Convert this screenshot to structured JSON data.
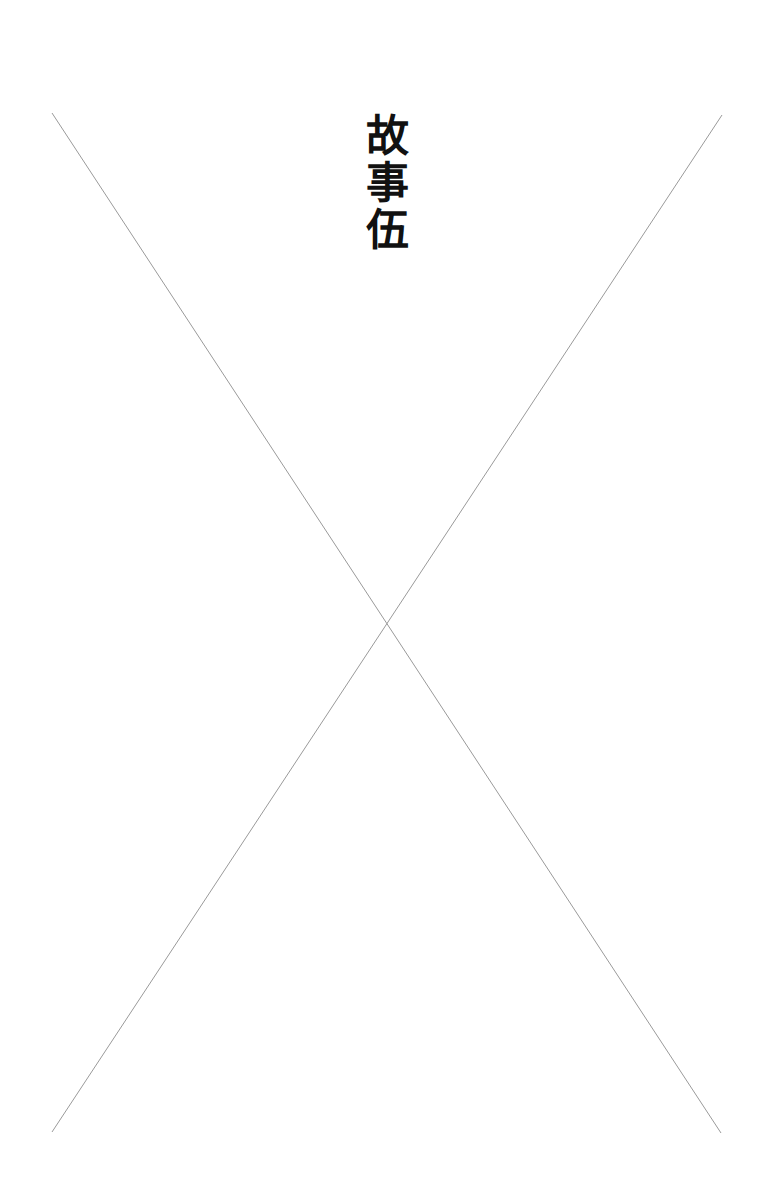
{
  "page": {
    "background": "#ffffff"
  },
  "title": {
    "text": "故事伍",
    "chars": [
      "故",
      "事",
      "伍"
    ],
    "color": "#111111",
    "orientation": "vertical"
  },
  "cross": {
    "stroke": "#9a9a9a",
    "stroke_width": 1,
    "line_a": {
      "x1": 52,
      "y1": 113,
      "x2": 721,
      "y2": 1133
    },
    "line_b": {
      "x1": 722,
      "y1": 115,
      "x2": 52,
      "y2": 1132
    }
  }
}
